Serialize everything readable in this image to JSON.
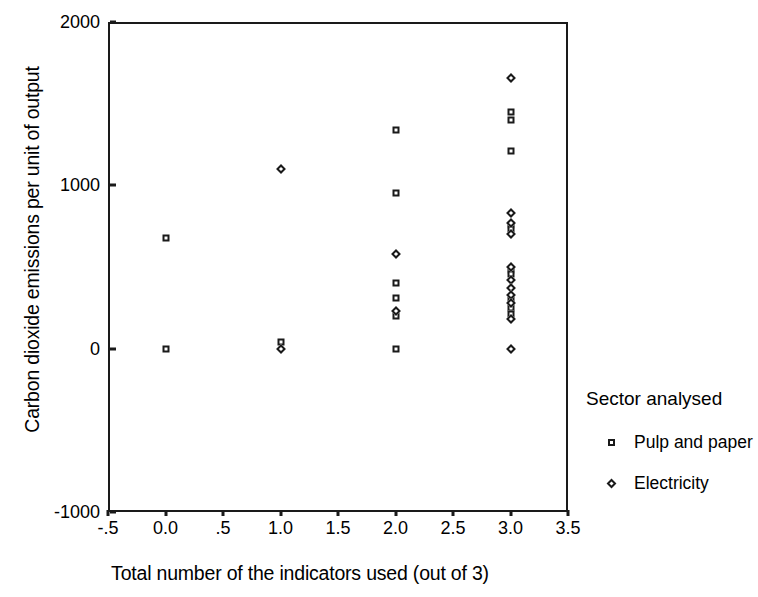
{
  "chart_data": {
    "type": "scatter",
    "title": "",
    "xlabel": "Total number of the indicators used (out of 3)",
    "ylabel": "Carbon dioxide emissions per unit of output",
    "xlim": [
      -0.5,
      3.5
    ],
    "ylim": [
      -1000,
      2000
    ],
    "xticks": [
      "-.5",
      "0.0",
      ".5",
      "1.0",
      "1.5",
      "2.0",
      "2.5",
      "3.0",
      "3.5"
    ],
    "xtick_values": [
      -0.5,
      0.0,
      0.5,
      1.0,
      1.5,
      2.0,
      2.5,
      3.0,
      3.5
    ],
    "yticks": [
      "2000",
      "1000",
      "0",
      "-1000"
    ],
    "ytick_values": [
      2000,
      1000,
      0,
      -1000
    ],
    "grid": false,
    "legend_position": "right",
    "legend_title": "Sector analysed",
    "series": [
      {
        "name": "Pulp and paper",
        "marker": "square",
        "points": [
          {
            "x": 0.0,
            "y": 680
          },
          {
            "x": 0.0,
            "y": 0
          },
          {
            "x": 1.0,
            "y": 40
          },
          {
            "x": 2.0,
            "y": 1340
          },
          {
            "x": 2.0,
            "y": 955
          },
          {
            "x": 2.0,
            "y": 400
          },
          {
            "x": 2.0,
            "y": 310
          },
          {
            "x": 2.0,
            "y": 200
          },
          {
            "x": 2.0,
            "y": 0
          },
          {
            "x": 3.0,
            "y": 1450
          },
          {
            "x": 3.0,
            "y": 1400
          },
          {
            "x": 3.0,
            "y": 1210
          },
          {
            "x": 3.0,
            "y": 760
          },
          {
            "x": 3.0,
            "y": 730
          },
          {
            "x": 3.0,
            "y": 480
          },
          {
            "x": 3.0,
            "y": 455
          },
          {
            "x": 3.0,
            "y": 300
          },
          {
            "x": 3.0,
            "y": 250
          },
          {
            "x": 3.0,
            "y": 215
          }
        ]
      },
      {
        "name": "Electricity",
        "marker": "diamond",
        "points": [
          {
            "x": 1.0,
            "y": 1100
          },
          {
            "x": 1.0,
            "y": 0
          },
          {
            "x": 2.0,
            "y": 580
          },
          {
            "x": 2.0,
            "y": 230
          },
          {
            "x": 3.0,
            "y": 1660
          },
          {
            "x": 3.0,
            "y": 830
          },
          {
            "x": 3.0,
            "y": 770
          },
          {
            "x": 3.0,
            "y": 700
          },
          {
            "x": 3.0,
            "y": 500
          },
          {
            "x": 3.0,
            "y": 420
          },
          {
            "x": 3.0,
            "y": 370
          },
          {
            "x": 3.0,
            "y": 330
          },
          {
            "x": 3.0,
            "y": 280
          },
          {
            "x": 3.0,
            "y": 180
          },
          {
            "x": 3.0,
            "y": 0
          }
        ]
      }
    ]
  },
  "legend": {
    "title": "Sector analysed",
    "items": [
      {
        "label": "Pulp and paper",
        "marker": "square-marker-icon"
      },
      {
        "label": "Electricity",
        "marker": "diamond-marker-icon"
      }
    ]
  },
  "axes": {
    "x_title": "Total number of the indicators used (out of 3)",
    "y_title": "Carbon dioxide emissions per unit of output"
  }
}
